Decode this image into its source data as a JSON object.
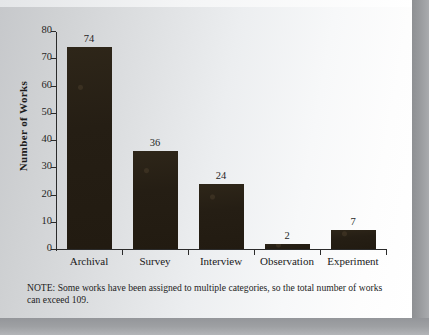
{
  "figure": {
    "note_text": "NOTE:  Some works have been assigned to multiple categories, so the total number of works can exceed 109."
  },
  "chart_data": {
    "type": "bar",
    "title": "",
    "xlabel": "",
    "ylabel": "Number of Works",
    "categories": [
      "Archival",
      "Survey",
      "Interview",
      "Observation",
      "Experiment"
    ],
    "values": [
      74,
      36,
      24,
      2,
      7
    ],
    "value_labels": [
      "74",
      "36",
      "24",
      "2",
      "7"
    ],
    "ylim": [
      0,
      80
    ],
    "yticks": [
      0,
      10,
      20,
      30,
      40,
      50,
      60,
      70,
      80
    ],
    "ytick_labels": [
      "0",
      "10",
      "20",
      "30",
      "40",
      "50",
      "60",
      "70",
      "80"
    ],
    "grid": false,
    "legend": false,
    "bar_color": "#251e14",
    "axis_color": "#2b2b2b",
    "text_color": "#1c1c1c"
  }
}
